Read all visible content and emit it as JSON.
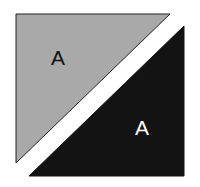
{
  "diagram": {
    "shapes": [
      {
        "name": "gray-triangle",
        "points": "16,14 170,14 16,163",
        "fill": "#a9a9a9",
        "stroke": "#222222",
        "label": "A",
        "label_color": "#111111",
        "label_x": 58,
        "label_y": 65
      },
      {
        "name": "black-triangle",
        "points": "184,26 184,176 29,176",
        "fill": "#131313",
        "stroke": "#131313",
        "label": "A",
        "label_color": "#ffffff",
        "label_x": 142,
        "label_y": 135
      }
    ]
  }
}
